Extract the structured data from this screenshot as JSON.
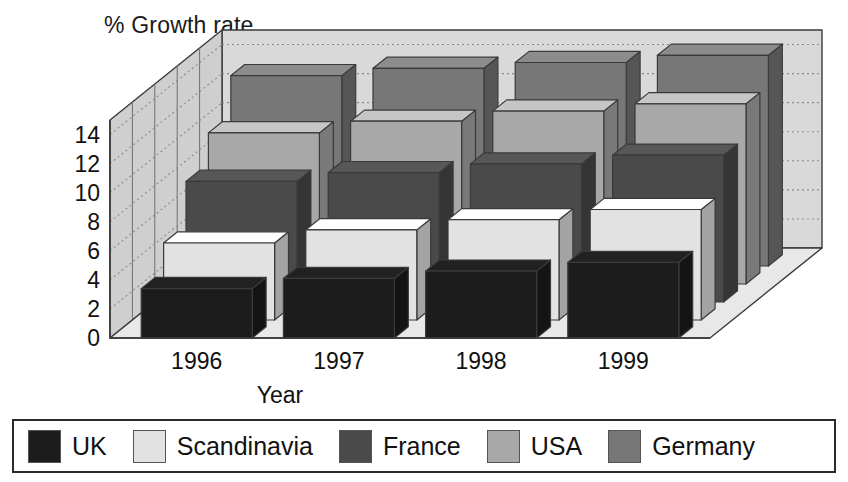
{
  "chart_data": {
    "type": "bar",
    "subtype": "3d-grouped-bar",
    "title": "% Growth rate",
    "xlabel": "Year",
    "ylabel": "% Growth rate",
    "categories": [
      "1996",
      "1997",
      "1998",
      "1999"
    ],
    "yticks": [
      "14",
      "12",
      "10",
      "8",
      "6",
      "4",
      "2",
      "0"
    ],
    "ylim": [
      0,
      15
    ],
    "ytick_step": 2,
    "grid": true,
    "grid_style": "dotted",
    "legend_position": "bottom",
    "series": [
      {
        "name": "UK",
        "color": "#1c1c1c",
        "values": [
          3.4,
          4.1,
          4.6,
          5.2
        ]
      },
      {
        "name": "Scandinavia",
        "color": "#e2e2e2",
        "values": [
          5.3,
          6.2,
          6.9,
          7.6
        ]
      },
      {
        "name": "France",
        "color": "#4a4a4a",
        "values": [
          8.3,
          8.9,
          9.5,
          10.1
        ]
      },
      {
        "name": "USA",
        "color": "#a8a8a8",
        "values": [
          10.4,
          11.2,
          11.9,
          12.4
        ]
      },
      {
        "name": "Germany",
        "color": "#777777",
        "values": [
          13.1,
          13.6,
          14.0,
          14.5
        ]
      }
    ]
  },
  "legend": {
    "items": [
      {
        "label": "UK",
        "color": "#1c1c1c"
      },
      {
        "label": "Scandinavia",
        "color": "#e2e2e2"
      },
      {
        "label": "France",
        "color": "#4a4a4a"
      },
      {
        "label": "USA",
        "color": "#a8a8a8"
      },
      {
        "label": "Germany",
        "color": "#777777"
      }
    ]
  },
  "colors": {
    "wall_back": "#d9d9d9",
    "wall_left": "#cfcfcf",
    "floor": "#e8e8e8",
    "outline": "#3a3a3a",
    "gridline": "#8a8a8a",
    "text": "#111111"
  }
}
